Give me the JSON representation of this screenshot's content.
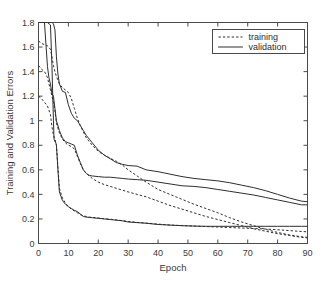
{
  "chart_data": {
    "type": "line",
    "title": "",
    "xlabel": "Epoch",
    "ylabel": "Training and Validation Errors",
    "xlim": [
      0,
      90
    ],
    "ylim": [
      0,
      1.8
    ],
    "xticks": [
      0,
      10,
      20,
      30,
      40,
      50,
      60,
      70,
      80,
      90
    ],
    "xticklabels": [
      "0",
      "10",
      "20",
      "30",
      "40",
      "50",
      "60",
      "70",
      "80",
      "90"
    ],
    "yticks": [
      0,
      0.2,
      0.4,
      0.6,
      0.8,
      1.0,
      1.2,
      1.4,
      1.6,
      1.8
    ],
    "yticklabels": [
      "0",
      "0.2",
      "0.4",
      "0.6",
      "0.8",
      "1",
      "1.2",
      "1.4",
      "1.6",
      "1.8"
    ],
    "grid": false,
    "legend": {
      "position": "top-right",
      "entries": [
        {
          "label": "training",
          "style": "dashed"
        },
        {
          "label": "validation",
          "style": "solid"
        }
      ]
    },
    "series": [
      {
        "name": "validation-run-1",
        "style": "solid",
        "x": [
          0,
          1,
          2,
          3,
          4,
          4.5,
          5,
          5.5,
          6,
          6.5,
          7,
          8,
          9,
          10,
          11,
          12,
          13,
          14,
          15,
          16,
          17,
          18,
          20,
          22,
          24,
          26,
          28,
          30,
          33,
          36,
          40,
          44,
          48,
          52,
          56,
          60,
          64,
          68,
          72,
          76,
          80,
          84,
          88,
          90
        ],
        "y": [
          1.8,
          1.8,
          1.8,
          1.8,
          1.8,
          1.8,
          1.79,
          1.74,
          1.52,
          1.38,
          1.3,
          1.24,
          1.23,
          1.13,
          1.06,
          1.02,
          1.0,
          0.96,
          0.92,
          0.88,
          0.85,
          0.82,
          0.76,
          0.72,
          0.69,
          0.66,
          0.645,
          0.635,
          0.63,
          0.6,
          0.585,
          0.565,
          0.545,
          0.53,
          0.52,
          0.51,
          0.495,
          0.475,
          0.455,
          0.43,
          0.4,
          0.37,
          0.345,
          0.34
        ]
      },
      {
        "name": "training-run-1",
        "style": "dashed",
        "x": [
          0,
          1,
          2,
          3,
          3.5,
          4,
          4.5,
          5,
          5.5,
          6,
          7,
          8,
          9,
          10,
          11,
          12,
          13,
          14,
          15,
          16,
          17,
          18,
          20,
          22,
          24,
          26,
          28,
          30,
          33,
          36,
          40,
          44,
          48,
          52,
          56,
          60,
          64,
          68,
          72,
          76,
          80,
          84,
          88,
          90
        ],
        "y": [
          1.65,
          1.63,
          1.62,
          1.61,
          1.6,
          1.58,
          1.52,
          1.45,
          1.4,
          1.36,
          1.3,
          1.27,
          1.25,
          1.23,
          1.18,
          1.1,
          1.02,
          0.96,
          0.91,
          0.86,
          0.83,
          0.8,
          0.75,
          0.72,
          0.695,
          0.67,
          0.64,
          0.6,
          0.55,
          0.5,
          0.44,
          0.4,
          0.36,
          0.32,
          0.285,
          0.25,
          0.21,
          0.175,
          0.145,
          0.115,
          0.09,
          0.07,
          0.055,
          0.05
        ]
      },
      {
        "name": "validation-run-2",
        "style": "solid",
        "x": [
          0,
          1,
          2,
          2.5,
          3,
          3.5,
          4,
          4.5,
          5,
          5.5,
          6,
          7,
          8,
          9,
          10,
          11,
          12,
          13,
          14,
          15,
          16,
          17,
          18,
          20,
          22,
          24,
          26,
          28,
          30,
          33,
          36,
          40,
          44,
          48,
          52,
          56,
          60,
          64,
          68,
          72,
          76,
          80,
          84,
          88,
          90
        ],
        "y": [
          1.8,
          1.8,
          1.8,
          1.62,
          1.44,
          1.35,
          1.3,
          1.22,
          1.2,
          1.1,
          1.0,
          0.92,
          0.86,
          0.83,
          0.82,
          0.81,
          0.8,
          0.72,
          0.66,
          0.6,
          0.57,
          0.555,
          0.55,
          0.545,
          0.54,
          0.54,
          0.535,
          0.53,
          0.525,
          0.52,
          0.515,
          0.5,
          0.485,
          0.47,
          0.465,
          0.455,
          0.44,
          0.425,
          0.41,
          0.395,
          0.375,
          0.355,
          0.335,
          0.315,
          0.315
        ]
      },
      {
        "name": "training-run-2",
        "style": "dashed",
        "x": [
          0,
          1,
          2,
          2.5,
          3,
          3.5,
          4,
          4.5,
          5,
          5.5,
          6,
          7,
          8,
          9,
          10,
          11,
          12,
          13,
          14,
          15,
          16,
          17,
          18,
          20,
          22,
          24,
          26,
          28,
          30,
          33,
          36,
          40,
          44,
          48,
          52,
          56,
          60,
          64,
          68,
          72,
          76,
          80,
          84,
          88,
          90
        ],
        "y": [
          1.45,
          1.42,
          1.4,
          1.38,
          1.35,
          1.3,
          1.25,
          1.2,
          1.15,
          1.08,
          0.98,
          0.9,
          0.85,
          0.82,
          0.8,
          0.79,
          0.77,
          0.71,
          0.65,
          0.6,
          0.57,
          0.55,
          0.53,
          0.5,
          0.48,
          0.465,
          0.45,
          0.435,
          0.42,
          0.4,
          0.38,
          0.345,
          0.31,
          0.28,
          0.25,
          0.22,
          0.195,
          0.17,
          0.145,
          0.12,
          0.1,
          0.08,
          0.065,
          0.05,
          0.045
        ]
      },
      {
        "name": "validation-run-3",
        "style": "solid",
        "x": [
          0,
          1,
          2,
          3,
          4,
          4.5,
          5,
          5.2,
          5.5,
          5.8,
          6,
          6.5,
          7,
          8,
          9,
          10,
          11,
          12,
          13,
          14,
          15,
          16,
          17,
          18,
          20,
          22,
          24,
          26,
          28,
          30,
          33,
          36,
          40,
          44,
          48,
          52,
          56,
          60,
          64,
          68,
          72,
          76,
          80,
          84,
          88,
          90
        ],
        "y": [
          1.8,
          1.8,
          1.8,
          1.8,
          1.78,
          1.45,
          1.0,
          0.85,
          0.83,
          0.82,
          0.8,
          0.6,
          0.42,
          0.35,
          0.32,
          0.3,
          0.285,
          0.27,
          0.26,
          0.24,
          0.22,
          0.215,
          0.212,
          0.21,
          0.205,
          0.2,
          0.195,
          0.19,
          0.185,
          0.175,
          0.17,
          0.165,
          0.155,
          0.15,
          0.145,
          0.142,
          0.14,
          0.14,
          0.14,
          0.14,
          0.14,
          0.14,
          0.14,
          0.14,
          0.14,
          0.14
        ]
      },
      {
        "name": "training-run-3",
        "style": "dashed",
        "x": [
          0,
          1,
          2,
          3,
          4,
          4.5,
          5,
          5.5,
          6,
          6.5,
          7,
          8,
          9,
          10,
          11,
          12,
          13,
          14,
          15,
          16,
          17,
          18,
          20,
          22,
          24,
          26,
          28,
          30,
          33,
          36,
          40,
          44,
          48,
          52,
          56,
          60,
          64,
          68,
          72,
          76,
          80,
          84,
          88,
          90
        ],
        "y": [
          1.2,
          1.18,
          1.15,
          1.12,
          1.05,
          0.95,
          0.88,
          0.85,
          0.8,
          0.62,
          0.45,
          0.37,
          0.33,
          0.3,
          0.28,
          0.265,
          0.25,
          0.235,
          0.225,
          0.22,
          0.215,
          0.212,
          0.208,
          0.202,
          0.198,
          0.192,
          0.186,
          0.18,
          0.172,
          0.166,
          0.158,
          0.15,
          0.146,
          0.142,
          0.138,
          0.134,
          0.13,
          0.126,
          0.122,
          0.118,
          0.112,
          0.105,
          0.098,
          0.095
        ]
      }
    ]
  },
  "colors": {
    "axis": "#4a4a4a",
    "line": "#2e2e2e",
    "background": "#ffffff"
  }
}
